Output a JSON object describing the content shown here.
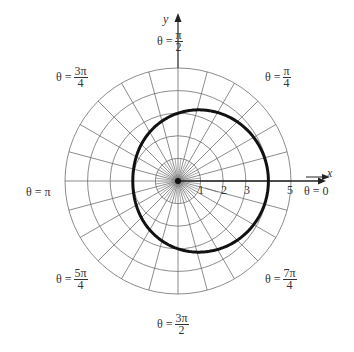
{
  "chart_data": {
    "type": "line",
    "subtype": "polar",
    "title": "",
    "equation": "r = 3 + cos θ",
    "center_px": [
      178,
      181
    ],
    "px_per_unit": 22.6,
    "radial_circles": [
      1,
      2,
      3,
      4,
      5
    ],
    "radial_tick_labels": [
      "1",
      "2",
      "3",
      "5"
    ],
    "angular_gridlines_deg_step": 15,
    "angle_labels": [
      {
        "angle": "0",
        "text": "θ = 0"
      },
      {
        "angle": "π/4",
        "num": "π",
        "den": "4"
      },
      {
        "angle": "π/2",
        "num": "π",
        "den": "2"
      },
      {
        "angle": "3π/4",
        "num": "3π",
        "den": "4"
      },
      {
        "angle": "π",
        "text": "θ = π"
      },
      {
        "angle": "5π/4",
        "num": "5π",
        "den": "4"
      },
      {
        "angle": "3π/2",
        "num": "3π",
        "den": "2"
      },
      {
        "angle": "7π/4",
        "num": "7π",
        "den": "4"
      }
    ],
    "curve_points_r_theta": [
      [
        4.0,
        0
      ],
      [
        3.87,
        30
      ],
      [
        3.5,
        60
      ],
      [
        3.0,
        90
      ],
      [
        2.5,
        120
      ],
      [
        2.13,
        150
      ],
      [
        2.0,
        180
      ],
      [
        2.13,
        210
      ],
      [
        2.5,
        240
      ],
      [
        3.0,
        270
      ],
      [
        3.5,
        300
      ],
      [
        3.87,
        330
      ]
    ],
    "xlabel": "x",
    "ylabel": "y",
    "rlim": [
      0,
      5
    ],
    "grid": true
  },
  "labels": {
    "x_axis": "x",
    "y_axis": "y",
    "theta_prefix": "θ =",
    "theta_0": "θ = 0",
    "theta_pi": "θ = π",
    "pi_2": {
      "num": "π",
      "den": "2"
    },
    "pi_4": {
      "num": "π",
      "den": "4"
    },
    "three_pi_4": {
      "num": "3π",
      "den": "4"
    },
    "five_pi_4": {
      "num": "5π",
      "den": "4"
    },
    "three_pi_2": {
      "num": "3π",
      "den": "2"
    },
    "seven_pi_4": {
      "num": "7π",
      "den": "4"
    },
    "ticks": [
      "1",
      "2",
      "3",
      "5"
    ]
  },
  "colors": {
    "grid": "#6e6e6e",
    "curve": "#111111",
    "axis": "#222222"
  }
}
